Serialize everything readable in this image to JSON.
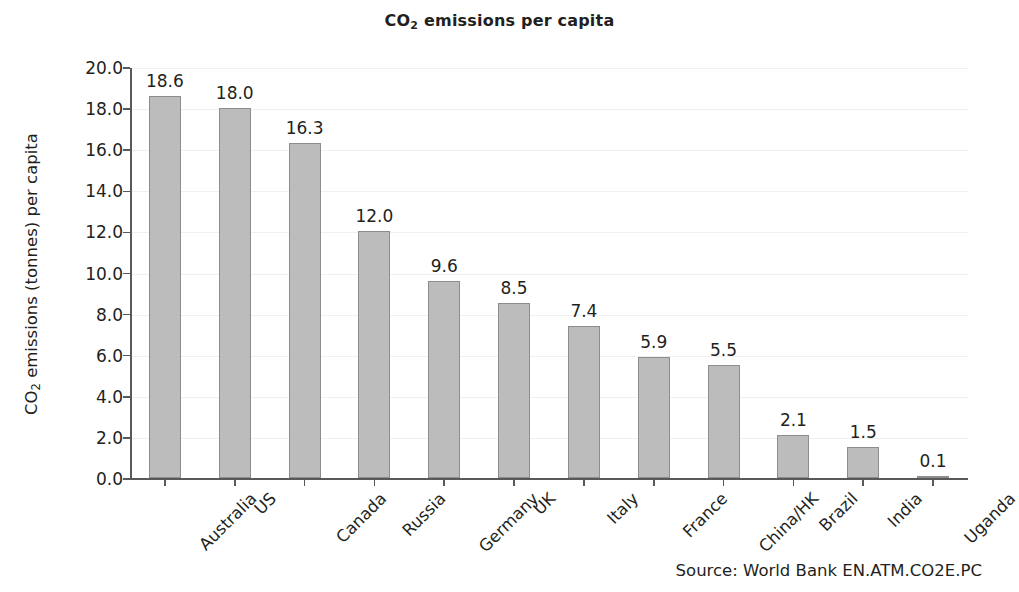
{
  "chart_data": {
    "type": "bar",
    "title": "CO2 emissions per capita",
    "title_parts": {
      "pre": "CO",
      "sub": "2",
      "post": " emissions per capita"
    },
    "xlabel": "",
    "ylabel": "CO2 emissions (tonnes) per capita",
    "ylabel_parts": {
      "pre": "CO",
      "sub": "2",
      "post": " emissions (tonnes) per capita"
    },
    "categories": [
      "Australia",
      "US",
      "Canada",
      "Russia",
      "Germany",
      "UK",
      "Italy",
      "France",
      "China/HK",
      "Brazil",
      "India",
      "Uganda"
    ],
    "values": [
      18.6,
      18.0,
      16.3,
      12.0,
      9.6,
      8.5,
      7.4,
      5.9,
      5.5,
      2.1,
      1.5,
      0.1
    ],
    "value_labels": [
      "18.6",
      "18.0",
      "16.3",
      "12.0",
      "9.6",
      "8.5",
      "7.4",
      "5.9",
      "5.5",
      "2.1",
      "1.5",
      "0.1"
    ],
    "ylim": [
      0,
      20
    ],
    "ytick_values": [
      0,
      2,
      4,
      6,
      8,
      10,
      12,
      14,
      16,
      18,
      20
    ],
    "ytick_labels": [
      "0.0",
      "2.0",
      "4.0",
      "6.0",
      "8.0",
      "10.0",
      "12.0",
      "14.0",
      "16.0",
      "18.0",
      "20.0"
    ],
    "grid": true,
    "grid_axis": "y",
    "legend": false,
    "bar_color": "#bcbcbc",
    "bar_edge_color": "#8d8d8d",
    "axis_color": "#58595b",
    "grid_color": "#f0f0f0",
    "text_color": "#231f20",
    "xtick_label_rotation": -45
  },
  "footer": {
    "source": "Source: World Bank EN.ATM.CO2E.PC"
  }
}
